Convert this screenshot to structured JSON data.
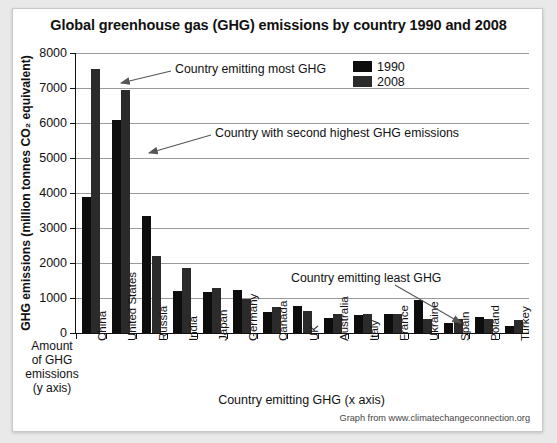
{
  "chart_data": {
    "type": "bar",
    "title": "Global greenhouse gas (GHG) emissions by country 1990 and 2008",
    "xlabel": "Country emitting GHG (x axis)",
    "ylabel": "GHG emissions (million tonnes CO₂ equivalent)",
    "ylim": [
      0,
      8000
    ],
    "ytick_values": [
      0,
      1000,
      2000,
      3000,
      4000,
      5000,
      6000,
      7000,
      8000
    ],
    "ytick_labels": [
      "0",
      "1000",
      "2000",
      "3000",
      "4000",
      "5000",
      "6000",
      "7000",
      "8000"
    ],
    "grid": true,
    "legend_position": "top-right",
    "categories": [
      "China",
      "United States",
      "Russia",
      "India",
      "Japan",
      "Germany",
      "Canada",
      "UK",
      "Australia",
      "Italy",
      "France",
      "Ukraine",
      "Spain",
      "Poland",
      "Turkey"
    ],
    "series": [
      {
        "name": "1990",
        "color": "#0d0d0d",
        "values": [
          3900,
          6100,
          3350,
          1200,
          1180,
          1220,
          595,
          770,
          420,
          520,
          540,
          950,
          290,
          450,
          200
        ]
      },
      {
        "name": "2008",
        "color": "#2b2b2b",
        "values": [
          7550,
          6950,
          2200,
          1850,
          1300,
          975,
          735,
          625,
          540,
          545,
          530,
          400,
          400,
          400,
          360
        ]
      }
    ],
    "annotations": [
      {
        "text": "Country emitting most GHG",
        "target": "China 2008 bar"
      },
      {
        "text": "Country with second highest GHG emissions",
        "target": "United States 1990 bar"
      },
      {
        "text": "Country emitting least GHG",
        "target": "Turkey bars"
      }
    ]
  },
  "axis_captions": {
    "y_caption_lines": [
      "Amount",
      "of GHG",
      "emissions",
      "(y axis)"
    ]
  },
  "legend": {
    "items": [
      {
        "label": "1990",
        "color": "#0d0d0d"
      },
      {
        "label": "2008",
        "color": "#2b2b2b"
      }
    ]
  },
  "footer": {
    "credit": "Graph from www.climatechangeconnection.org"
  }
}
